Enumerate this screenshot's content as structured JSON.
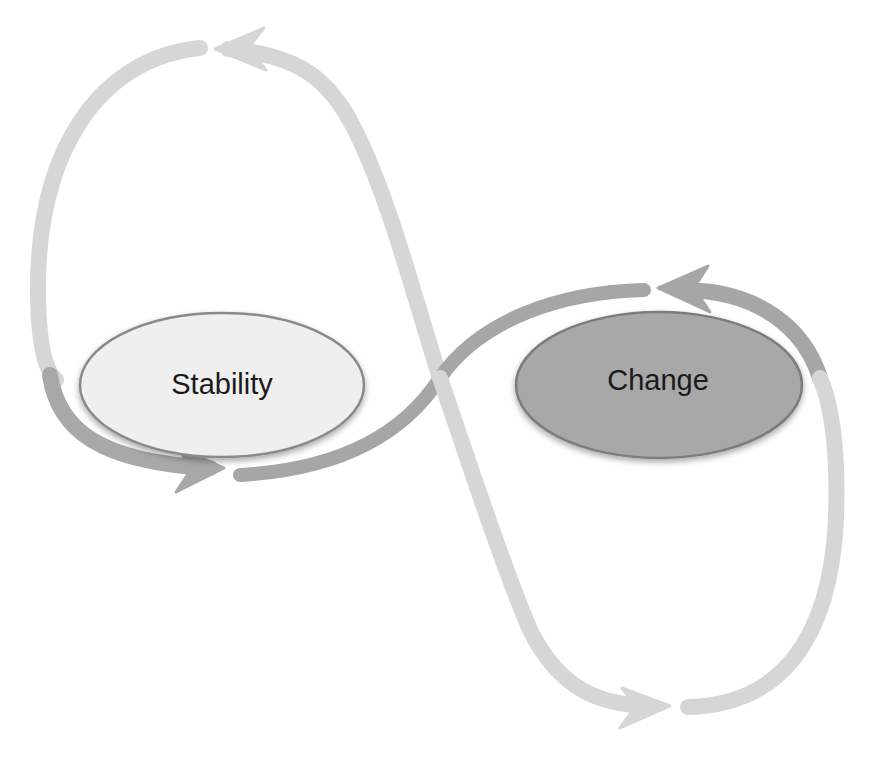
{
  "diagram": {
    "type": "figure-eight cycle",
    "background": "#ffffff",
    "nodes": [
      {
        "id": "stability",
        "label": "Stability",
        "fill": "#efefef",
        "stroke": "#8a8a8a",
        "center": [
          222,
          385
        ],
        "rx": 142,
        "ry": 72
      },
      {
        "id": "change",
        "label": "Change",
        "fill": "#a8a8a8",
        "stroke": "#7c7c7c",
        "center": [
          659,
          385
        ],
        "rx": 143,
        "ry": 73
      }
    ],
    "arrows": [
      {
        "id": "arrow-top-loop",
        "from": "stability",
        "to": "top",
        "direction": "counter-clockwise",
        "color": "#d4d4d4"
      },
      {
        "id": "arrow-to-stability",
        "description": "from crossing toward Stability bottom",
        "color": "#a9a9a9"
      },
      {
        "id": "arrow-to-change",
        "description": "from crossing toward Change top",
        "color": "#a9a9a9"
      },
      {
        "id": "arrow-bottom-loop",
        "from": "crossing",
        "to": "bottom",
        "direction": "clockwise",
        "color": "#d4d4d4"
      }
    ],
    "colors": {
      "light_arrow": "#d6d6d6",
      "dark_arrow": "#a6a6a6",
      "stability_fill": "#efefef",
      "change_fill": "#a8a8a8",
      "text": "#1a1a1a"
    }
  }
}
